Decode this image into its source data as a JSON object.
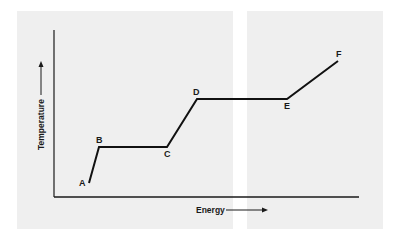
{
  "chart_data": {
    "type": "line",
    "title": "",
    "xlabel": "Energy",
    "ylabel": "Temperature",
    "axis_arrows": true,
    "grid": false,
    "legend": null,
    "tick_labels": {
      "x": [],
      "y": []
    },
    "points": [
      {
        "label": "A",
        "x": 35,
        "y": 14
      },
      {
        "label": "B",
        "x": 45,
        "y": 50
      },
      {
        "label": "C",
        "x": 113,
        "y": 50
      },
      {
        "label": "D",
        "x": 143,
        "y": 98
      },
      {
        "label": "E",
        "x": 233,
        "y": 98
      },
      {
        "label": "F",
        "x": 284,
        "y": 136
      }
    ],
    "segments": [
      {
        "from": "A",
        "to": "B",
        "kind": "rising"
      },
      {
        "from": "B",
        "to": "C",
        "kind": "plateau"
      },
      {
        "from": "C",
        "to": "D",
        "kind": "rising"
      },
      {
        "from": "D",
        "to": "E",
        "kind": "plateau"
      },
      {
        "from": "E",
        "to": "F",
        "kind": "rising"
      }
    ],
    "xlim": [
      0,
      305
    ],
    "ylim": [
      0,
      167
    ],
    "note": "Coordinates are relative pixel units from the axis origin; no numeric scale is shown."
  },
  "labels": {
    "A": "A",
    "B": "B",
    "C": "C",
    "D": "D",
    "E": "E",
    "F": "F",
    "xaxis": "Energy",
    "yaxis": "Temperature"
  }
}
